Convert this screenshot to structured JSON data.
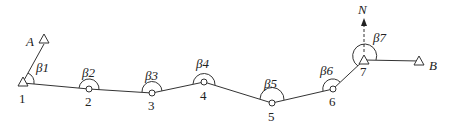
{
  "diagram": {
    "type": "traverse survey diagram",
    "control_points": {
      "A": {
        "label": "A"
      },
      "B": {
        "label": "B"
      }
    },
    "north": {
      "label": "N"
    },
    "stations": [
      {
        "id": "1",
        "label": "1",
        "angle": "β1",
        "marker": "triangle"
      },
      {
        "id": "2",
        "label": "2",
        "angle": "β2",
        "marker": "circle"
      },
      {
        "id": "3",
        "label": "3",
        "angle": "β3",
        "marker": "circle"
      },
      {
        "id": "4",
        "label": "4",
        "angle": "β4",
        "marker": "circle"
      },
      {
        "id": "5",
        "label": "5",
        "angle": "β5",
        "marker": "circle"
      },
      {
        "id": "6",
        "label": "6",
        "angle": "β6",
        "marker": "circle"
      },
      {
        "id": "7",
        "label": "7",
        "angle": "β7",
        "marker": "triangle"
      }
    ],
    "colors": {
      "stroke": "#333333",
      "background": "#ffffff"
    }
  }
}
